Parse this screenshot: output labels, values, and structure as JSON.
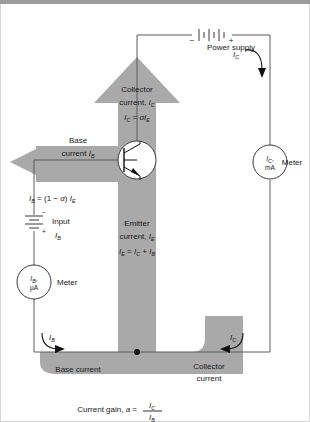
{
  "figure": {
    "background_color": "#ffffff",
    "flow_fill": "#a9a9a9",
    "wire_color": "#555555",
    "text_color": "#1a1a1a"
  },
  "power_supply": {
    "label": "Power supply",
    "minus": "−",
    "plus": "+"
  },
  "collector_arrow": {
    "line1": "Collector",
    "line2_pre": "current, ",
    "line2_sym": "I",
    "line2_sub": "C",
    "eq_lhs_sym": "I",
    "eq_lhs_sub": "C",
    "eq_rel": " = ",
    "eq_alpha": "α",
    "eq_rhs_sym": "I",
    "eq_rhs_sub": "E"
  },
  "emitter_label": {
    "line1": "Emitter",
    "line2_pre": "current, ",
    "line2_sym": "I",
    "line2_sub": "E",
    "eq": "I_E = I_C + I_B",
    "eq_parts": [
      "I",
      "E",
      " = ",
      "I",
      "C",
      " + ",
      "I",
      "B"
    ]
  },
  "base_arrow": {
    "line1": "Base",
    "line2_pre": "current ",
    "line2_sym": "I",
    "line2_sub": "B",
    "eq_parts": [
      "I",
      "B",
      " = (1 − ",
      "α",
      ") ",
      "I",
      "E"
    ]
  },
  "input_source": {
    "minus": "−",
    "plus": "+",
    "label": "Input",
    "current_sym": "I",
    "current_sub": "B"
  },
  "base_meter": {
    "line1_sym": "I",
    "line1_sub": "B",
    "line1_comma": ",",
    "line2": "μA",
    "caption": "Meter"
  },
  "collector_meter": {
    "line1_sym": "I",
    "line1_sub": "C",
    "line1_comma": ",",
    "line2": "mA",
    "caption": "Meter"
  },
  "arrow_tags": {
    "ic_top_sym": "I",
    "ic_top_sub": "C",
    "ib_bottom_sym": "I",
    "ib_bottom_sub": "B",
    "ic_bottom_sym": "I",
    "ic_bottom_sub": "C",
    "ib_left_sym": "I",
    "ib_left_sub": "B"
  },
  "bottom_labels": {
    "base_current": "Base current",
    "collector_current_l1": "Collector",
    "collector_current_l2": "current"
  },
  "caption": {
    "pre": "Current gain, ",
    "var": "a",
    "rel": " = ",
    "num_sym": "I",
    "num_sub": "C",
    "den_sym": "I",
    "den_sub": "B"
  }
}
